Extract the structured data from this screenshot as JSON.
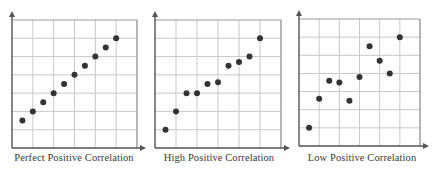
{
  "colors": {
    "dot": "#333333",
    "grid": "#c9c9c9",
    "axis": "#555555",
    "caption": "#3a3a3a"
  },
  "chart_data": [
    {
      "type": "scatter",
      "title": "Perfect Positive Correlation",
      "xlabel": "",
      "ylabel": "",
      "grid": true,
      "xlim": [
        0,
        6
      ],
      "ylim": [
        0,
        7
      ],
      "x_ticks_labeled": false,
      "y_ticks_labeled": false,
      "points": [
        {
          "x": 0.5,
          "y": 1.5
        },
        {
          "x": 1.0,
          "y": 2.0
        },
        {
          "x": 1.5,
          "y": 2.5
        },
        {
          "x": 2.0,
          "y": 3.0
        },
        {
          "x": 2.5,
          "y": 3.5
        },
        {
          "x": 3.0,
          "y": 4.0
        },
        {
          "x": 3.5,
          "y": 4.5
        },
        {
          "x": 4.0,
          "y": 5.0
        },
        {
          "x": 4.5,
          "y": 5.5
        },
        {
          "x": 5.0,
          "y": 6.0
        }
      ]
    },
    {
      "type": "scatter",
      "title": "High Positive Correlation",
      "xlabel": "",
      "ylabel": "",
      "grid": true,
      "xlim": [
        0,
        6
      ],
      "ylim": [
        0,
        7
      ],
      "x_ticks_labeled": false,
      "y_ticks_labeled": false,
      "points": [
        {
          "x": 0.5,
          "y": 1.0
        },
        {
          "x": 1.0,
          "y": 2.0
        },
        {
          "x": 1.5,
          "y": 3.0
        },
        {
          "x": 2.0,
          "y": 3.0
        },
        {
          "x": 2.5,
          "y": 3.5
        },
        {
          "x": 3.0,
          "y": 3.6
        },
        {
          "x": 3.5,
          "y": 4.5
        },
        {
          "x": 4.0,
          "y": 4.7
        },
        {
          "x": 4.5,
          "y": 5.0
        },
        {
          "x": 5.0,
          "y": 6.0
        }
      ]
    },
    {
      "type": "scatter",
      "title": "Low Positive Correlation",
      "xlabel": "",
      "ylabel": "",
      "grid": true,
      "xlim": [
        0,
        6
      ],
      "ylim": [
        0,
        7
      ],
      "x_ticks_labeled": false,
      "y_ticks_labeled": false,
      "points": [
        {
          "x": 0.5,
          "y": 1.0
        },
        {
          "x": 1.0,
          "y": 2.6
        },
        {
          "x": 1.5,
          "y": 3.6
        },
        {
          "x": 2.0,
          "y": 3.5
        },
        {
          "x": 2.5,
          "y": 2.5
        },
        {
          "x": 3.0,
          "y": 3.8
        },
        {
          "x": 3.5,
          "y": 5.5
        },
        {
          "x": 4.0,
          "y": 4.7
        },
        {
          "x": 4.5,
          "y": 4.0
        },
        {
          "x": 5.0,
          "y": 6.0
        }
      ]
    }
  ],
  "layout": {
    "panels": [
      {
        "left": 12,
        "top": 20,
        "width": 125,
        "height": 128,
        "panel_left": 0,
        "panel_width": 148
      },
      {
        "left": 155,
        "top": 20,
        "width": 126,
        "height": 128,
        "panel_left": 145,
        "panel_width": 148
      },
      {
        "left": 299,
        "top": 19,
        "width": 121,
        "height": 127,
        "panel_left": 290,
        "panel_width": 144
      }
    ]
  }
}
